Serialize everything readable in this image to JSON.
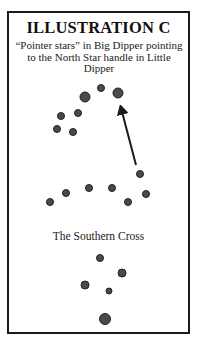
{
  "title": "ILLUSTRATION C",
  "caption": "“Pointer stars” in Big Dipper pointing to the North Star handle in Little Dipper",
  "southern_cross_label": "The Southern Cross",
  "colors": {
    "star_fill": "#4a4a4a",
    "star_stroke": "#222222",
    "arrow": "#1a1a1a",
    "border": "#1a1a1a"
  },
  "big_dipper": [
    {
      "x": 85,
      "y": 97,
      "r": 5
    },
    {
      "x": 101,
      "y": 88,
      "r": 3.5
    },
    {
      "x": 118,
      "y": 93,
      "r": 5
    },
    {
      "x": 78,
      "y": 113,
      "r": 3.5
    },
    {
      "x": 61,
      "y": 116,
      "r": 3.5
    },
    {
      "x": 57,
      "y": 129,
      "r": 3.5
    },
    {
      "x": 73,
      "y": 132,
      "r": 3.5
    }
  ],
  "little_dipper": [
    {
      "x": 140,
      "y": 174,
      "r": 3.5
    },
    {
      "x": 146,
      "y": 194,
      "r": 3.5
    },
    {
      "x": 128,
      "y": 202,
      "r": 3.5
    },
    {
      "x": 112,
      "y": 188,
      "r": 3.5
    },
    {
      "x": 89,
      "y": 188,
      "r": 3.5
    },
    {
      "x": 66,
      "y": 193,
      "r": 3.5
    },
    {
      "x": 50,
      "y": 202,
      "r": 3.5
    }
  ],
  "southern_cross": [
    {
      "x": 100,
      "y": 258,
      "r": 3.5
    },
    {
      "x": 122,
      "y": 273,
      "r": 4
    },
    {
      "x": 85,
      "y": 285,
      "r": 4
    },
    {
      "x": 109,
      "y": 291,
      "r": 3
    },
    {
      "x": 105,
      "y": 319,
      "r": 5.5
    }
  ],
  "arrow": {
    "from": {
      "x": 136,
      "y": 165
    },
    "to": {
      "x": 120,
      "y": 104
    }
  }
}
